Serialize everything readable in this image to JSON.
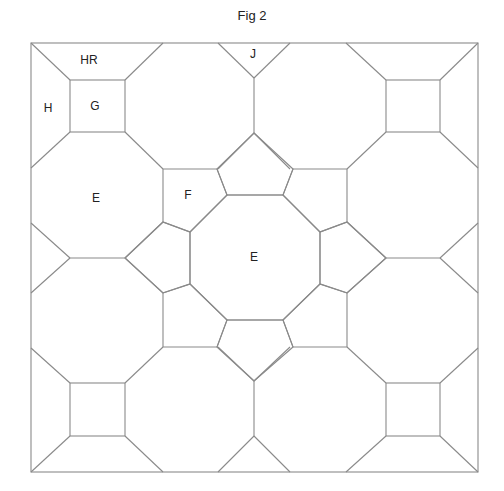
{
  "figure": {
    "title": "Fig 2",
    "labels": [
      {
        "id": "HR",
        "text": "HR",
        "x": 89,
        "y": 60
      },
      {
        "id": "J",
        "text": "J",
        "x": 253,
        "y": 54
      },
      {
        "id": "H",
        "text": "H",
        "x": 48,
        "y": 108
      },
      {
        "id": "G",
        "text": "G",
        "x": 95,
        "y": 106
      },
      {
        "id": "E-left",
        "text": "E",
        "x": 96,
        "y": 198
      },
      {
        "id": "F",
        "text": "F",
        "x": 188,
        "y": 195
      },
      {
        "id": "E-center",
        "text": "E",
        "x": 254,
        "y": 257
      }
    ]
  },
  "colors": {
    "line": "#8a8a8a",
    "text": "#222222",
    "background": "#ffffff"
  }
}
